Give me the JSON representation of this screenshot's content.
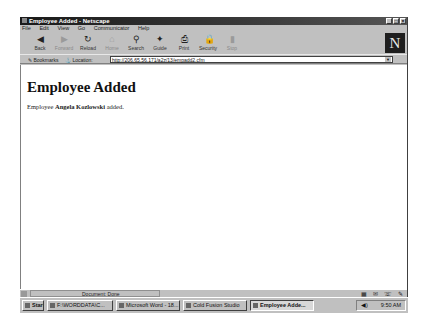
{
  "window": {
    "title": "Employee Added - Netscape",
    "controls": [
      "minimize",
      "maximize",
      "close"
    ]
  },
  "menubar": [
    "File",
    "Edit",
    "View",
    "Go",
    "Communicator",
    "Help"
  ],
  "toolbar": [
    {
      "label": "Back",
      "icon": "back-arrow-icon",
      "glyph": "◀",
      "disabled": false
    },
    {
      "label": "Forward",
      "icon": "forward-arrow-icon",
      "glyph": "▶",
      "disabled": true
    },
    {
      "label": "Reload",
      "icon": "reload-icon",
      "glyph": "↻",
      "disabled": false
    },
    {
      "label": "Home",
      "icon": "home-icon",
      "glyph": "⌂",
      "disabled": true
    },
    {
      "label": "Search",
      "icon": "search-icon",
      "glyph": "⚲",
      "disabled": false
    },
    {
      "label": "Guide",
      "icon": "guide-icon",
      "glyph": "✦",
      "disabled": false
    },
    {
      "label": "Print",
      "icon": "print-icon",
      "glyph": "⎙",
      "disabled": false
    },
    {
      "label": "Security",
      "icon": "security-lock-icon",
      "glyph": "🔒",
      "disabled": false
    },
    {
      "label": "Stop",
      "icon": "stop-icon",
      "glyph": "▮",
      "disabled": true
    }
  ],
  "location": {
    "bookmarks_label": "Bookmarks",
    "location_label": "Location:",
    "url": "http://206.65.56.171/a2z/13/empadd2.cfm"
  },
  "page": {
    "heading": "Employee Added",
    "text_prefix": "Employee",
    "employee_name": "Angela Kozlowski",
    "text_suffix": "added."
  },
  "statusbar": {
    "text": "Document: Done"
  },
  "taskbar": {
    "start_label": "Start",
    "items": [
      {
        "label": "F:\\WORDDATA\\C...",
        "active": false
      },
      {
        "label": "Microsoft Word - 18...",
        "active": false
      },
      {
        "label": "Cold Fusion Studio",
        "active": false
      },
      {
        "label": "Employee Adde...",
        "active": true
      }
    ],
    "clock": "9:50 AM"
  }
}
